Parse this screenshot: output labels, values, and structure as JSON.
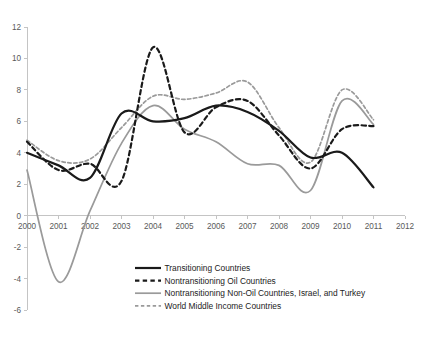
{
  "chart_data": {
    "type": "line",
    "title": "",
    "subtitle": "",
    "xlabel": "",
    "ylabel": "",
    "x": [
      2000,
      2001,
      2002,
      2003,
      2004,
      2005,
      2006,
      2007,
      2008,
      2009,
      2010,
      2011
    ],
    "xlim": [
      2000,
      2012
    ],
    "ylim": [
      -6,
      12
    ],
    "xticks": [
      "2000",
      "2001",
      "2002",
      "2003",
      "2004",
      "2005",
      "2006",
      "2007",
      "2008",
      "2009",
      "2010",
      "2011",
      "2012"
    ],
    "yticks": [
      "-6",
      "-4",
      "-2",
      "0",
      "2",
      "4",
      "6",
      "8",
      "10",
      "12"
    ],
    "grid": false,
    "legend_position": "inside-bottom-center",
    "series": [
      {
        "name": "Transitioning Countries",
        "style": "solid",
        "color": "#1a1a1a",
        "width": 2.2,
        "values": [
          4.0,
          3.2,
          2.4,
          6.5,
          6.0,
          6.2,
          7.0,
          6.6,
          5.4,
          3.7,
          4.0,
          1.8
        ]
      },
      {
        "name": "Nontransitioning Oil Countries",
        "style": "dashed",
        "color": "#1a1a1a",
        "width": 2.2,
        "values": [
          4.7,
          2.9,
          3.3,
          2.2,
          10.7,
          5.3,
          6.9,
          7.3,
          5.1,
          3.0,
          5.5,
          5.7
        ]
      },
      {
        "name": "Nontransitioning Non-Oil Countries, Israel, and Turkey",
        "style": "solid",
        "color": "#9a9a9a",
        "width": 1.7,
        "values": [
          2.9,
          -4.2,
          0.3,
          4.6,
          7.0,
          5.5,
          4.7,
          3.3,
          3.2,
          1.6,
          7.3,
          5.8
        ]
      },
      {
        "name": "World Middle Income Countries",
        "style": "dashed",
        "color": "#9a9a9a",
        "width": 1.7,
        "values": [
          4.8,
          3.5,
          3.6,
          5.6,
          7.6,
          7.4,
          7.8,
          8.5,
          5.6,
          3.4,
          8.0,
          6.1
        ]
      }
    ]
  },
  "legend": {
    "entries": [
      {
        "label": "Transitioning Countries"
      },
      {
        "label": "Nontransitioning Oil Countries"
      },
      {
        "label": "Nontransitioning Non-Oil Countries, Israel, and Turkey"
      },
      {
        "label": "World Middle Income Countries"
      }
    ]
  }
}
